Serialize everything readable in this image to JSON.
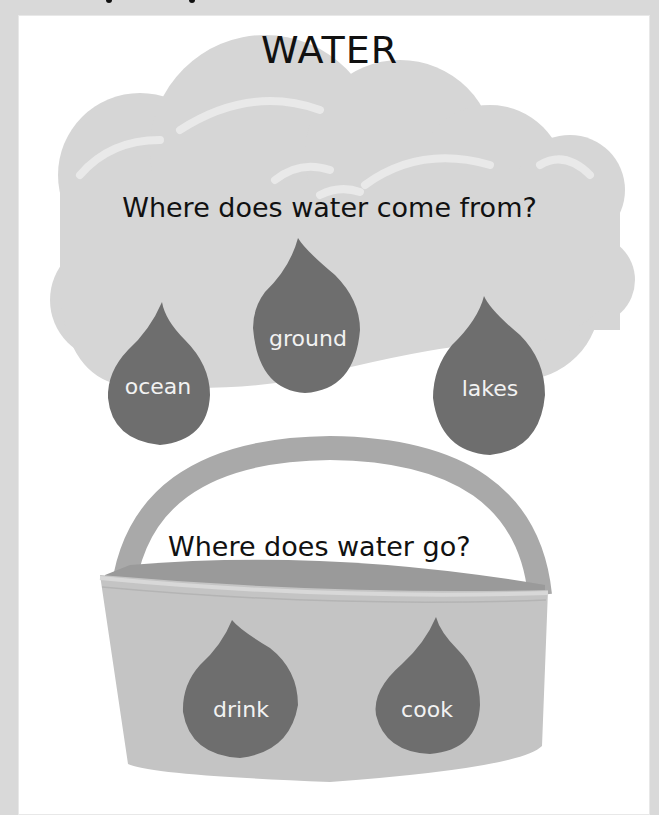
{
  "page": {
    "title": "WATER",
    "colors": {
      "background": "#d9d9d9",
      "card": "#ffffff",
      "cloud": "#d6d6d6",
      "cloud_highlight": "#e9e9e9",
      "drop": "#6e6e6e",
      "bucket_body": "#c4c4c4",
      "bucket_handle": "#a9a9a9",
      "bucket_inside": "#9a9a9a",
      "text": "#111111",
      "drop_text": "#f2f2f2"
    }
  },
  "sources": {
    "question": "Where does water come from?",
    "drops": [
      {
        "label": "ocean"
      },
      {
        "label": "ground"
      },
      {
        "label": "lakes"
      }
    ]
  },
  "uses": {
    "question": "Where does water go?",
    "drops": [
      {
        "label": "drink"
      },
      {
        "label": "cook"
      }
    ]
  }
}
